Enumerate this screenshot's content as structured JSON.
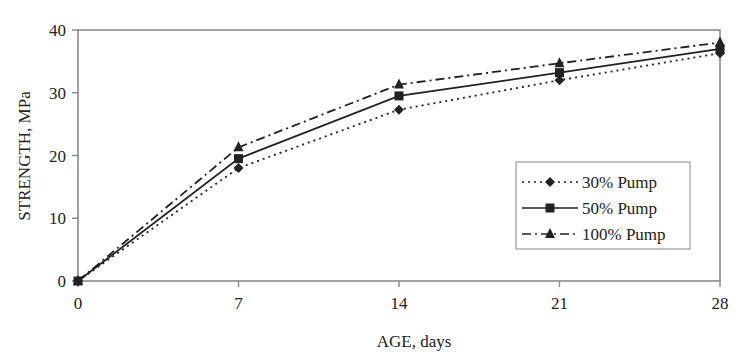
{
  "chart_data": {
    "type": "line",
    "title": "",
    "xlabel": "AGE, days",
    "ylabel": "STRENGTH, MPa",
    "x": [
      0,
      7,
      14,
      21,
      28
    ],
    "xticks": [
      "0",
      "7",
      "14",
      "21",
      "28"
    ],
    "yticks": [
      "0",
      "10",
      "20",
      "30",
      "40"
    ],
    "xlim": [
      0,
      28
    ],
    "ylim": [
      0,
      40
    ],
    "grid": false,
    "legend_position": "right-center inside plot",
    "series": [
      {
        "name": "30% Pump",
        "marker": "diamond",
        "line": "dotted",
        "values": [
          0,
          18.0,
          27.3,
          32.0,
          36.3
        ]
      },
      {
        "name": "50% Pump",
        "marker": "square",
        "line": "solid",
        "values": [
          0,
          19.5,
          29.5,
          33.2,
          37.0
        ]
      },
      {
        "name": "100% Pump",
        "marker": "triangle",
        "line": "dash-dot",
        "values": [
          0,
          21.3,
          31.3,
          34.7,
          38.0
        ]
      }
    ]
  },
  "colors": {
    "series": "#222222",
    "axis": "#8a8a8a",
    "legend_border": "#9a9a9a"
  }
}
